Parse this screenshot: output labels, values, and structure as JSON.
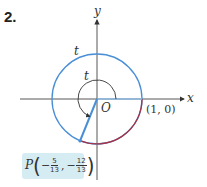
{
  "problem_number": "2.",
  "axes": {
    "x_label": "x",
    "y_label": "y",
    "origin_label": "O"
  },
  "point_one": "(1, 0)",
  "arc_label_outer": "t",
  "arc_label_inner": "t",
  "point_P": {
    "name": "P",
    "x_sign": "−",
    "x_num": "5",
    "x_den": "13",
    "y_sign": "−",
    "y_num": "12",
    "y_den": "13",
    "separator": ","
  },
  "colors": {
    "circle_blue": "#4a8fd6",
    "arc_red": "#a83244",
    "radius_blue": "#4a8fd6",
    "label_box": "#d6ecf3"
  }
}
